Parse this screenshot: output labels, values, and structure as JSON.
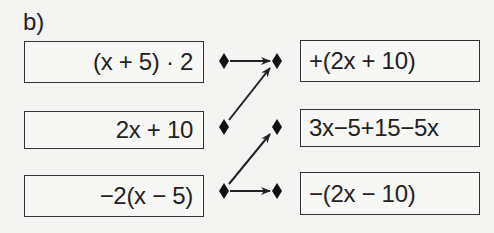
{
  "exercise_label": "b)",
  "left_terms": [
    {
      "text": "(x + 5) · 2"
    },
    {
      "text": "2x + 10"
    },
    {
      "text": "−2(x − 5)"
    }
  ],
  "right_terms": [
    {
      "text": "+(2x + 10)"
    },
    {
      "text": "3x−5+15−5x"
    },
    {
      "text": "−(2x − 10)"
    }
  ],
  "connections": [
    {
      "from": "left-1",
      "to": "right-1"
    },
    {
      "from": "left-2",
      "to": "right-1"
    },
    {
      "from": "left-3",
      "to": "right-2"
    },
    {
      "from": "left-3",
      "to": "right-3"
    }
  ],
  "colors": {
    "ink": "#222222",
    "background": "#f4f4f2"
  }
}
